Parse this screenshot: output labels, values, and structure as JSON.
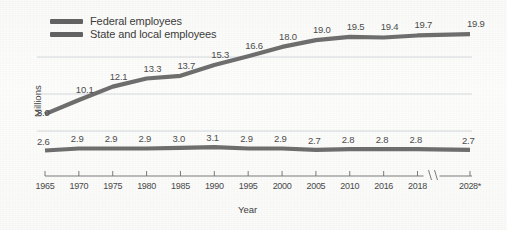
{
  "chart_data": {
    "type": "line",
    "title": "",
    "xlabel": "Year",
    "ylabel": "Millions",
    "grid": "horizontal-light",
    "legend_position": "top-left",
    "x_axis_break": "between 2018 and 2028*",
    "categories": [
      "1965",
      "1970",
      "1975",
      "1980",
      "1985",
      "1990",
      "1995",
      "2000",
      "2005",
      "2010",
      "2016",
      "2018",
      "2028*"
    ],
    "ylim": [
      0,
      22
    ],
    "series": [
      {
        "name": "Federal employees",
        "color": "#636363",
        "values": [
          2.6,
          2.9,
          2.9,
          2.9,
          3.0,
          3.1,
          2.9,
          2.9,
          2.7,
          2.8,
          2.8,
          2.8,
          2.7
        ],
        "labels": [
          "2.6",
          "2.9",
          "2.9",
          "2.9",
          "3.0",
          "3.1",
          "2.9",
          "2.9",
          "2.7",
          "2.8",
          "2.8",
          "2.8",
          "2.7"
        ]
      },
      {
        "name": "State and local employees",
        "color": "#636363",
        "values": [
          8.0,
          10.1,
          12.1,
          13.3,
          13.7,
          15.3,
          16.6,
          18.0,
          19.0,
          19.5,
          19.4,
          19.7,
          19.9
        ],
        "labels": [
          "8.0",
          "10.1",
          "12.1",
          "13.3",
          "13.7",
          "15.3",
          "16.6",
          "18.0",
          "19.0",
          "19.5",
          "19.4",
          "19.7",
          "19.9"
        ]
      }
    ]
  },
  "legend": {
    "items": [
      {
        "label": "Federal employees",
        "color": "#636363"
      },
      {
        "label": "State and local employees",
        "color": "#636363"
      }
    ]
  },
  "axes": {
    "y_title": "Millions",
    "x_title": "Year",
    "x_ticks": [
      "1965",
      "1970",
      "1975",
      "1980",
      "1985",
      "1990",
      "1995",
      "2000",
      "2005",
      "2010",
      "2016",
      "2018",
      "2028*"
    ]
  },
  "colors": {
    "line": "#636363",
    "line_dark": "#565656",
    "gridline": "#c9cfd4",
    "axis": "#6d6d6d",
    "text": "#4a4a4a"
  }
}
